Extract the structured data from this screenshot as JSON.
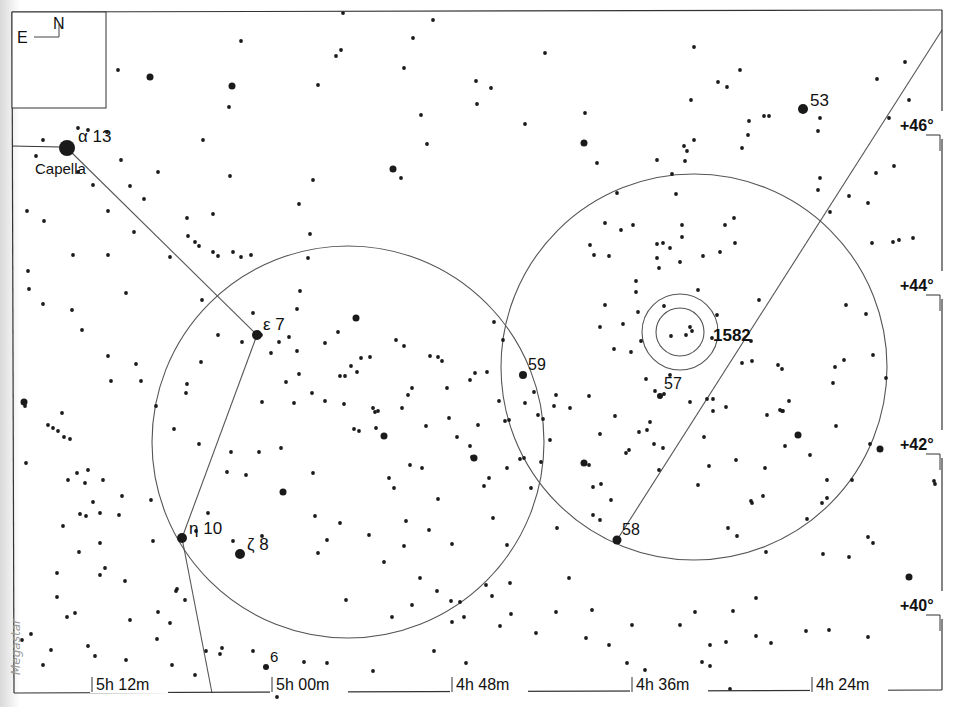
{
  "chart_title": "Star chart: Auriga / Perseus border region",
  "credit": "Megastar",
  "compass": {
    "north": "N",
    "east": "E"
  },
  "frame": {
    "x1": 12,
    "y1": 12,
    "x2": 942,
    "y2": 693
  },
  "ra_ticks": [
    {
      "label": "5h 12m",
      "x": 92
    },
    {
      "label": "5h 00m",
      "x": 272
    },
    {
      "label": "4h 48m",
      "x": 452
    },
    {
      "label": "4h 36m",
      "x": 632
    },
    {
      "label": "4h 24m",
      "x": 812
    }
  ],
  "dec_ticks": [
    {
      "label": "+46°",
      "y": 125
    },
    {
      "label": "+44°",
      "y": 285
    },
    {
      "label": "+42°",
      "y": 444
    },
    {
      "label": "+40°",
      "y": 605
    }
  ],
  "named_stars": [
    {
      "greek": "α",
      "flam": "13",
      "name": "Capella",
      "x": 67,
      "y": 148,
      "r": 8
    },
    {
      "greek": "ε",
      "flam": "7",
      "x": 257,
      "y": 335,
      "r": 5
    },
    {
      "greek": "η",
      "flam": "10",
      "x": 182,
      "y": 538,
      "r": 5
    },
    {
      "greek": "ζ",
      "flam": "8",
      "x": 240,
      "y": 554,
      "r": 5
    },
    {
      "greek": "",
      "flam": "53",
      "x": 803,
      "y": 109,
      "r": 5
    },
    {
      "greek": "",
      "flam": "59",
      "x": 523,
      "y": 375,
      "r": 4
    },
    {
      "greek": "",
      "flam": "57",
      "x": 660,
      "y": 396,
      "r": 3
    },
    {
      "greek": "",
      "flam": "58",
      "x": 617,
      "y": 540,
      "r": 4.5
    },
    {
      "greek": "",
      "flam": "6",
      "x": 266,
      "y": 667,
      "r": 3
    }
  ],
  "labels": {
    "capella": "Capella",
    "alpha": "α  13",
    "epsilon": "ε 7",
    "eta": "η  10",
    "zeta": "ζ 8",
    "s53": "53",
    "s59": "59",
    "s57": "57",
    "s58": "58",
    "s6": "6",
    "ngc1582": "1582"
  },
  "circles": [
    {
      "name": "finder-field-left",
      "cx": 348,
      "cy": 442,
      "r": 196
    },
    {
      "name": "finder-field-right",
      "cx": 694,
      "cy": 367,
      "r": 193
    },
    {
      "name": "ngc1582-outer",
      "cx": 680,
      "cy": 332,
      "r": 38
    },
    {
      "name": "ngc1582-inner",
      "cx": 680,
      "cy": 332,
      "r": 24
    }
  ],
  "lines": [
    {
      "name": "capella-to-epsilon",
      "points": [
        [
          67,
          148
        ],
        [
          257,
          335
        ]
      ]
    },
    {
      "name": "epsilon-to-eta",
      "points": [
        [
          257,
          335
        ],
        [
          182,
          538
        ]
      ]
    },
    {
      "name": "eta-to-bottom",
      "points": [
        [
          182,
          538
        ],
        [
          212,
          693
        ]
      ]
    },
    {
      "name": "star58-to-top-right",
      "points": [
        [
          617,
          540
        ],
        [
          942,
          30
        ]
      ]
    }
  ],
  "field_stars": [
    [
      24,
      402,
      3.5
    ],
    [
      27,
      211
    ],
    [
      29,
      289
    ],
    [
      36,
      156
    ],
    [
      43,
      140
    ],
    [
      62,
      413
    ],
    [
      68,
      480
    ],
    [
      73,
      255
    ],
    [
      78,
      128
    ],
    [
      78,
      172
    ],
    [
      88,
      130
    ],
    [
      82,
      101
    ],
    [
      93,
      185
    ],
    [
      107,
      132
    ],
    [
      108,
      211
    ],
    [
      118,
      70
    ],
    [
      150,
      77,
      3.5
    ],
    [
      130,
      186
    ],
    [
      121,
      160
    ],
    [
      134,
      232
    ],
    [
      144,
      199
    ],
    [
      158,
      172
    ],
    [
      187,
      218
    ],
    [
      230,
      176
    ],
    [
      170,
      257
    ],
    [
      195,
      242
    ],
    [
      202,
      300
    ],
    [
      213,
      252
    ],
    [
      218,
      335
    ],
    [
      232,
      86,
      3.5
    ],
    [
      241,
      41
    ],
    [
      229,
      107
    ],
    [
      203,
      140
    ],
    [
      199,
      246
    ],
    [
      218,
      256
    ],
    [
      241,
      257
    ],
    [
      253,
      313
    ],
    [
      313,
      180
    ],
    [
      318,
      85
    ],
    [
      341,
      50
    ],
    [
      336,
      56
    ],
    [
      343,
      13
    ],
    [
      393,
      169,
      3.5
    ],
    [
      401,
      178
    ],
    [
      404,
      68
    ],
    [
      413,
      38
    ],
    [
      421,
      115
    ],
    [
      427,
      144
    ],
    [
      476,
      81
    ],
    [
      433,
      20
    ],
    [
      477,
      104
    ],
    [
      491,
      88
    ],
    [
      525,
      124
    ],
    [
      545,
      53
    ],
    [
      584,
      143,
      3.5
    ],
    [
      585,
      113
    ],
    [
      676,
      194
    ],
    [
      605,
      223
    ],
    [
      597,
      163
    ],
    [
      617,
      193
    ],
    [
      657,
      160
    ],
    [
      672,
      174
    ],
    [
      691,
      100
    ],
    [
      682,
      237
    ],
    [
      684,
      146
    ],
    [
      687,
      151
    ],
    [
      685,
      161
    ],
    [
      694,
      47
    ],
    [
      727,
      87
    ],
    [
      740,
      70
    ],
    [
      718,
      82
    ],
    [
      703,
      256
    ],
    [
      725,
      225
    ],
    [
      734,
      218
    ],
    [
      749,
      121
    ],
    [
      748,
      135
    ],
    [
      764,
      116
    ],
    [
      769,
      116
    ],
    [
      818,
      131
    ],
    [
      876,
      173
    ],
    [
      894,
      166
    ],
    [
      889,
      118
    ],
    [
      905,
      62
    ],
    [
      909,
      100
    ],
    [
      877,
      79
    ],
    [
      924,
      123
    ],
    [
      913,
      238
    ],
    [
      893,
      242
    ],
    [
      899,
      240
    ],
    [
      866,
      314
    ],
    [
      873,
      355
    ],
    [
      886,
      378
    ],
    [
      870,
      444
    ],
    [
      868,
      537
    ],
    [
      934,
      481
    ],
    [
      935,
      484
    ],
    [
      873,
      543
    ],
    [
      849,
      557
    ],
    [
      909,
      577,
      3.5
    ],
    [
      928,
      453
    ],
    [
      810,
      455
    ],
    [
      827,
      498
    ],
    [
      823,
      554
    ],
    [
      807,
      519
    ],
    [
      789,
      401
    ],
    [
      783,
      411
    ],
    [
      767,
      415
    ],
    [
      751,
      501
    ],
    [
      752,
      503
    ],
    [
      756,
      598
    ],
    [
      771,
      643
    ],
    [
      829,
      630
    ],
    [
      806,
      631
    ],
    [
      868,
      637
    ],
    [
      911,
      605
    ],
    [
      733,
      611
    ],
    [
      756,
      636
    ],
    [
      702,
      662
    ],
    [
      710,
      645
    ],
    [
      710,
      666
    ],
    [
      700,
      684
    ],
    [
      730,
      689
    ],
    [
      726,
      642
    ],
    [
      675,
      679
    ],
    [
      645,
      670
    ],
    [
      627,
      663
    ],
    [
      695,
      612
    ],
    [
      680,
      625
    ],
    [
      632,
      625
    ],
    [
      609,
      645
    ],
    [
      586,
      638
    ],
    [
      592,
      610
    ],
    [
      569,
      578
    ],
    [
      510,
      583
    ],
    [
      507,
      545
    ],
    [
      556,
      612
    ],
    [
      536,
      633
    ],
    [
      500,
      626
    ],
    [
      471,
      681
    ],
    [
      434,
      651
    ],
    [
      451,
      601
    ],
    [
      412,
      605
    ],
    [
      466,
      663
    ],
    [
      437,
      591
    ],
    [
      420,
      578
    ],
    [
      392,
      617
    ],
    [
      373,
      671
    ],
    [
      327,
      663
    ],
    [
      304,
      662
    ],
    [
      277,
      697
    ],
    [
      285,
      689
    ],
    [
      253,
      651
    ],
    [
      220,
      654
    ],
    [
      170,
      623
    ],
    [
      158,
      612
    ],
    [
      185,
      600
    ],
    [
      130,
      620
    ],
    [
      95,
      656
    ],
    [
      88,
      646
    ],
    [
      75,
      613
    ],
    [
      67,
      617
    ],
    [
      57,
      597
    ],
    [
      51,
      650
    ],
    [
      43,
      665
    ],
    [
      31,
      634
    ],
    [
      101,
      681
    ],
    [
      150,
      680
    ],
    [
      172,
      665
    ],
    [
      176,
      591
    ],
    [
      222,
      648
    ],
    [
      195,
      675
    ],
    [
      206,
      651
    ],
    [
      157,
      639
    ],
    [
      126,
      660
    ],
    [
      22,
      640
    ],
    [
      57,
      573
    ],
    [
      63,
      526
    ],
    [
      80,
      514
    ],
    [
      86,
      516
    ],
    [
      85,
      483
    ],
    [
      88,
      470
    ],
    [
      93,
      502
    ],
    [
      100,
      513
    ],
    [
      100,
      543
    ],
    [
      79,
      552
    ],
    [
      100,
      575
    ],
    [
      105,
      568
    ],
    [
      125,
      581
    ],
    [
      119,
      515
    ],
    [
      122,
      496
    ],
    [
      103,
      480
    ],
    [
      151,
      500
    ],
    [
      153,
      541
    ],
    [
      177,
      589
    ],
    [
      196,
      531
    ],
    [
      208,
      513
    ],
    [
      262,
      536
    ],
    [
      227,
      472
    ],
    [
      231,
      452
    ],
    [
      246,
      475
    ],
    [
      259,
      452
    ],
    [
      199,
      444
    ],
    [
      174,
      429
    ],
    [
      187,
      384
    ],
    [
      156,
      406
    ],
    [
      136,
      364
    ],
    [
      141,
      381
    ],
    [
      58,
      431
    ],
    [
      64,
      437
    ],
    [
      70,
      439
    ],
    [
      53,
      428
    ],
    [
      48,
      425
    ],
    [
      26,
      463
    ],
    [
      77,
      473
    ],
    [
      108,
      356
    ],
    [
      111,
      381
    ],
    [
      126,
      293
    ],
    [
      108,
      255
    ],
    [
      82,
      330
    ],
    [
      72,
      310
    ],
    [
      43,
      304
    ],
    [
      28,
      271
    ],
    [
      25,
      406
    ],
    [
      44,
      221
    ],
    [
      188,
      236
    ],
    [
      213,
      214
    ],
    [
      233,
      252
    ],
    [
      251,
      255
    ],
    [
      299,
      204
    ],
    [
      310,
      234
    ],
    [
      308,
      258
    ],
    [
      300,
      291
    ],
    [
      297,
      309
    ],
    [
      325,
      343
    ],
    [
      345,
      376
    ],
    [
      361,
      358
    ],
    [
      356,
      318,
      3.5
    ],
    [
      354,
      429
    ],
    [
      338,
      332
    ],
    [
      351,
      366
    ],
    [
      340,
      376
    ],
    [
      357,
      372
    ],
    [
      370,
      357
    ],
    [
      376,
      428
    ],
    [
      373,
      408
    ],
    [
      375,
      412
    ],
    [
      378,
      411
    ],
    [
      384,
      436,
      3.5
    ],
    [
      394,
      488
    ],
    [
      402,
      408
    ],
    [
      408,
      395
    ],
    [
      412,
      388
    ],
    [
      410,
      465
    ],
    [
      422,
      468
    ],
    [
      430,
      356
    ],
    [
      438,
      357
    ],
    [
      447,
      388
    ],
    [
      442,
      361
    ],
    [
      449,
      418
    ],
    [
      457,
      437
    ],
    [
      470,
      446
    ],
    [
      472,
      457
    ],
    [
      474,
      458,
      3.5
    ],
    [
      484,
      486
    ],
    [
      487,
      372
    ],
    [
      489,
      478
    ],
    [
      475,
      373
    ],
    [
      470,
      380
    ],
    [
      478,
      425
    ],
    [
      499,
      401
    ],
    [
      503,
      340
    ],
    [
      505,
      421
    ],
    [
      507,
      468
    ],
    [
      509,
      420
    ],
    [
      494,
      322
    ],
    [
      404,
      346
    ],
    [
      396,
      340
    ],
    [
      297,
      351
    ],
    [
      299,
      374
    ],
    [
      325,
      401
    ],
    [
      344,
      404
    ],
    [
      312,
      393
    ],
    [
      294,
      403
    ],
    [
      281,
      448
    ],
    [
      286,
      382
    ],
    [
      262,
      402
    ],
    [
      261,
      335
    ],
    [
      271,
      353
    ],
    [
      279,
      342
    ],
    [
      289,
      337
    ],
    [
      242,
      342
    ],
    [
      201,
      362
    ],
    [
      186,
      393
    ],
    [
      233,
      541
    ],
    [
      283,
      492,
      3.5
    ],
    [
      327,
      540
    ],
    [
      340,
      523
    ],
    [
      346,
      600
    ],
    [
      369,
      535
    ],
    [
      404,
      546
    ],
    [
      406,
      521
    ],
    [
      429,
      530
    ],
    [
      389,
      478
    ],
    [
      452,
      544
    ],
    [
      438,
      499
    ],
    [
      493,
      518
    ],
    [
      460,
      602
    ],
    [
      464,
      617
    ],
    [
      511,
      614
    ],
    [
      486,
      585
    ],
    [
      492,
      596
    ],
    [
      452,
      622
    ],
    [
      384,
      562
    ],
    [
      318,
      553
    ],
    [
      313,
      473
    ],
    [
      315,
      516
    ],
    [
      359,
      431
    ],
    [
      426,
      426
    ],
    [
      531,
      488
    ],
    [
      541,
      462
    ],
    [
      543,
      419
    ],
    [
      554,
      406
    ],
    [
      550,
      440
    ],
    [
      557,
      528
    ],
    [
      593,
      515
    ],
    [
      593,
      487
    ],
    [
      584,
      463,
      3.5
    ],
    [
      570,
      408
    ],
    [
      600,
      434
    ],
    [
      615,
      416
    ],
    [
      647,
      430
    ],
    [
      650,
      422
    ],
    [
      639,
      432
    ],
    [
      646,
      379
    ],
    [
      655,
      391
    ],
    [
      664,
      394
    ],
    [
      670,
      375
    ],
    [
      713,
      399
    ],
    [
      726,
      407
    ],
    [
      798,
      435,
      3.5
    ],
    [
      833,
      383
    ],
    [
      835,
      367
    ],
    [
      844,
      360
    ],
    [
      836,
      426
    ],
    [
      852,
      480
    ],
    [
      827,
      480
    ],
    [
      728,
      528
    ],
    [
      737,
      536
    ],
    [
      763,
      496
    ],
    [
      766,
      552
    ],
    [
      785,
      446
    ],
    [
      778,
      365
    ],
    [
      752,
      361
    ],
    [
      782,
      369
    ],
    [
      780,
      410
    ],
    [
      782,
      411
    ],
    [
      736,
      460
    ],
    [
      765,
      468
    ],
    [
      822,
      503
    ],
    [
      880,
      449,
      3.5
    ],
    [
      846,
      305
    ],
    [
      872,
      243
    ],
    [
      830,
      212
    ],
    [
      849,
      196
    ],
    [
      818,
      190
    ],
    [
      820,
      178
    ],
    [
      868,
      203
    ],
    [
      820,
      118
    ],
    [
      742,
      148
    ],
    [
      694,
      140
    ],
    [
      735,
      243
    ],
    [
      720,
      252
    ],
    [
      682,
      225
    ],
    [
      680,
      262
    ],
    [
      659,
      268
    ],
    [
      636,
      281
    ],
    [
      631,
      352
    ],
    [
      614,
      349
    ],
    [
      600,
      327
    ],
    [
      605,
      305
    ],
    [
      590,
      245
    ],
    [
      594,
      255
    ],
    [
      609,
      256
    ],
    [
      621,
      230
    ],
    [
      633,
      225
    ],
    [
      663,
      243
    ],
    [
      657,
      244
    ],
    [
      670,
      248
    ],
    [
      636,
      292
    ],
    [
      641,
      341
    ],
    [
      623,
      324
    ],
    [
      638,
      312
    ],
    [
      657,
      258
    ],
    [
      664,
      306
    ],
    [
      690,
      327
    ],
    [
      692,
      331
    ],
    [
      686,
      335
    ],
    [
      671,
      336
    ],
    [
      698,
      290
    ],
    [
      717,
      315
    ],
    [
      712,
      338
    ],
    [
      759,
      300
    ],
    [
      751,
      341
    ],
    [
      742,
      363
    ],
    [
      713,
      411
    ],
    [
      707,
      399
    ],
    [
      690,
      402
    ],
    [
      704,
      437
    ],
    [
      709,
      466
    ],
    [
      698,
      485
    ],
    [
      654,
      444
    ],
    [
      663,
      448
    ],
    [
      659,
      470
    ],
    [
      629,
      450
    ],
    [
      611,
      500
    ],
    [
      601,
      484
    ],
    [
      626,
      453
    ],
    [
      589,
      396
    ],
    [
      556,
      395
    ],
    [
      538,
      415
    ],
    [
      525,
      403
    ],
    [
      524,
      458
    ],
    [
      600,
      520
    ],
    [
      589,
      465
    ],
    [
      534,
      392
    ],
    [
      520,
      459
    ]
  ],
  "colors": {
    "ink": "#1a1a1a",
    "line": "#555555",
    "paper": "#ffffff"
  }
}
